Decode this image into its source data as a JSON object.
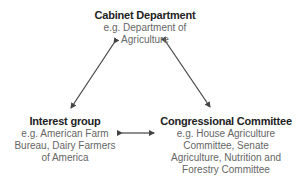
{
  "nodes": {
    "cabinet": {
      "title": "Cabinet Department",
      "line1": "e.g. Department of",
      "line2": "Agriculture"
    },
    "interest": {
      "title": "Interest group",
      "line1": "e.g. American Farm",
      "line2": "Bureau, Dairy Farmers",
      "line3": "of America"
    },
    "congress": {
      "title": "Congressional Committee",
      "line1": "e.g. House Agriculture",
      "line2": "Committee, Senate",
      "line3": "Agriculture, Nutrition and",
      "line4": "Forestry Committee"
    }
  },
  "edges": [
    {
      "from": "cabinet",
      "to": "interest",
      "direction": "bidirectional"
    },
    {
      "from": "cabinet",
      "to": "congress",
      "direction": "bidirectional"
    },
    {
      "from": "interest",
      "to": "congress",
      "direction": "bidirectional"
    }
  ],
  "colors": {
    "title": "#222222",
    "subtitle": "#666666",
    "arrow": "#444444"
  }
}
